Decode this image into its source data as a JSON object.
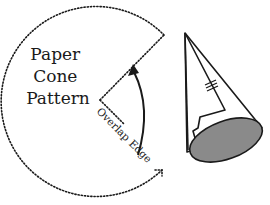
{
  "diagram": {
    "title_lines": [
      "Paper",
      "Cone",
      "Pattern"
    ],
    "edge_label": "Overlap Edge",
    "colors": {
      "stroke": "#1a1a1a",
      "cone_base": "#8a8a8a",
      "background": "#ffffff"
    },
    "elements": [
      {
        "id": "cone-pattern",
        "type": "dotted-circle-sector"
      },
      {
        "id": "fold-arrow",
        "type": "curved-arrow"
      },
      {
        "id": "paper-cone",
        "type": "3d-cone"
      }
    ]
  }
}
